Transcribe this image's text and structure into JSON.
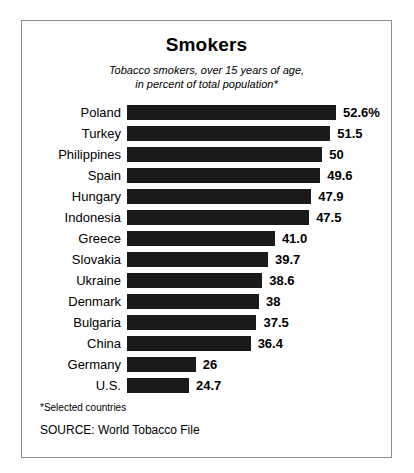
{
  "chart_data": {
    "type": "bar",
    "orientation": "horizontal",
    "title": "Smokers",
    "subtitle_line1": "Tobacco smokers, over 15 years of age,",
    "subtitle_line2": "in percent of total population*",
    "xlabel": "",
    "ylabel": "",
    "xlim": [
      0,
      52.6
    ],
    "grid": false,
    "legend": "none",
    "bar_color": "#1a1a1a",
    "categories": [
      "Poland",
      "Turkey",
      "Philippines",
      "Spain",
      "Hungary",
      "Indonesia",
      "Greece",
      "Slovakia",
      "Ukraine",
      "Denmark",
      "Bulgaria",
      "China",
      "Germany",
      "U.S."
    ],
    "values": [
      52.6,
      51.5,
      50,
      49.6,
      47.9,
      47.5,
      41.0,
      39.7,
      38.6,
      38,
      37.5,
      36.4,
      26,
      24.7
    ],
    "value_labels": [
      "52.6%",
      "51.5",
      "50",
      "49.6",
      "47.9",
      "47.5",
      "41.0",
      "39.7",
      "38.6",
      "38",
      "37.5",
      "36.4",
      "26",
      "24.7"
    ],
    "footnote": "*Selected countries",
    "source": "SOURCE: World Tobacco File"
  }
}
